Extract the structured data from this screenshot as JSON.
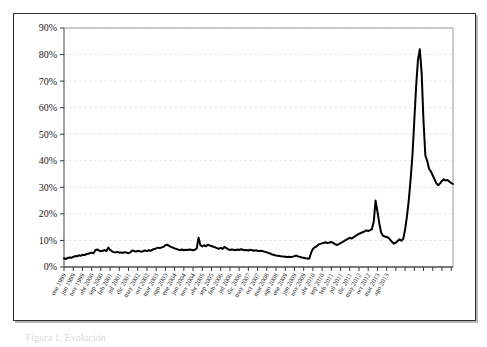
{
  "figure": {
    "background_color": "#ffffff",
    "frame_color": "#2c2c2c",
    "caption_partial": "Figura 1. Evolución"
  },
  "chart_data": {
    "type": "line",
    "title": "",
    "subtitle": "",
    "xlabel": "",
    "ylabel": "",
    "ylim": [
      0,
      90
    ],
    "ytick_labels": [
      "0%",
      "10%",
      "20%",
      "30%",
      "40%",
      "50%",
      "60%",
      "70%",
      "80%",
      "90%"
    ],
    "ytick_values": [
      0,
      10,
      20,
      30,
      40,
      50,
      60,
      70,
      80,
      90
    ],
    "grid": true,
    "grid_style": "dashed",
    "grid_color": "#e3e3e3",
    "legend": false,
    "legend_position": "none",
    "line_color": "#000000",
    "line_width": 2,
    "xtick_labels": [
      "ene 1999",
      "jun 1999",
      "nov 1999",
      "abr 2000",
      "sep 2000",
      "feb 2001",
      "jul 2001",
      "dic 2001",
      "may 2002",
      "oct 2002",
      "mar 2003",
      "ago 2003",
      "ene 2004",
      "jun 2004",
      "nov 2004",
      "abr 2005",
      "sep 2005",
      "feb 2006",
      "jul 2006",
      "dic 2006",
      "may 2007",
      "oct 2007",
      "mar 2008",
      "ago 2008",
      "ene 2009",
      "jun 2009",
      "nov 2009",
      "abr 2010",
      "sep 2010",
      "feb 2011",
      "jul 2011",
      "dic 2011",
      "may 2012",
      "oct 2012",
      "mar 2013",
      "ago 2013"
    ],
    "xtick_interval_months": 5,
    "x_start": "ene 1999",
    "x_end": "dic 2013",
    "x_label_rotation_deg": 60,
    "series": [
      {
        "name": "serie",
        "values": [
          3.3,
          3.0,
          3.4,
          3.6,
          3.5,
          3.8,
          4.1,
          4.0,
          4.4,
          4.2,
          4.6,
          4.5,
          4.8,
          5.0,
          5.2,
          5.4,
          5.2,
          6.3,
          6.6,
          6.2,
          5.9,
          6.1,
          6.4,
          6.0,
          7.3,
          6.5,
          5.9,
          5.6,
          5.5,
          5.7,
          5.4,
          5.5,
          5.3,
          5.6,
          5.4,
          5.2,
          5.5,
          6.2,
          6.0,
          5.8,
          6.1,
          6.0,
          5.7,
          6.0,
          6.2,
          6.0,
          6.3,
          6.1,
          6.5,
          6.8,
          7.0,
          7.3,
          7.1,
          7.4,
          7.6,
          8.2,
          8.4,
          8.0,
          7.6,
          7.3,
          7.0,
          6.8,
          6.5,
          6.4,
          6.6,
          6.3,
          6.5,
          6.4,
          6.6,
          6.5,
          6.3,
          6.5,
          7.0,
          11.0,
          8.2,
          7.7,
          8.2,
          7.8,
          8.4,
          8.1,
          7.9,
          7.6,
          7.4,
          7.1,
          6.9,
          7.2,
          6.8,
          7.6,
          7.1,
          6.7,
          6.4,
          6.6,
          6.5,
          6.3,
          6.6,
          6.4,
          6.7,
          6.5,
          6.3,
          6.4,
          6.2,
          6.5,
          6.3,
          6.1,
          6.3,
          6.1,
          6.0,
          6.1,
          5.9,
          5.7,
          5.5,
          5.3,
          5.0,
          4.7,
          4.5,
          4.3,
          4.2,
          4.1,
          4.0,
          4.0,
          3.9,
          3.8,
          3.9,
          3.8,
          3.9,
          4.1,
          4.3,
          4.0,
          3.8,
          3.6,
          3.5,
          3.3,
          3.2,
          3.1,
          5.3,
          6.8,
          7.4,
          7.8,
          8.4,
          8.7,
          8.9,
          9.1,
          9.3,
          9.0,
          9.2,
          9.4,
          9.1,
          8.6,
          8.3,
          8.6,
          9.0,
          9.4,
          9.8,
          10.2,
          10.6,
          11.0,
          10.7,
          11.2,
          11.6,
          12.1,
          12.5,
          12.8,
          13.1,
          13.4,
          13.8,
          13.5,
          13.9,
          14.2,
          17.0,
          25.0,
          21.0,
          16.5,
          13.0,
          11.8,
          11.5,
          11.3,
          11.0,
          10.2,
          9.4,
          8.8,
          9.2,
          9.8,
          10.4,
          9.9,
          10.6,
          14.0,
          19.0,
          25.0,
          33.0,
          42.0,
          55.0,
          68.0,
          78.0,
          82.0,
          73.0,
          55.0,
          42.0,
          40.0,
          37.0,
          36.0,
          34.5,
          33.0,
          31.5,
          30.8,
          31.5,
          32.4,
          33.0,
          32.6,
          32.8,
          32.2,
          31.6,
          31.3
        ]
      }
    ]
  }
}
